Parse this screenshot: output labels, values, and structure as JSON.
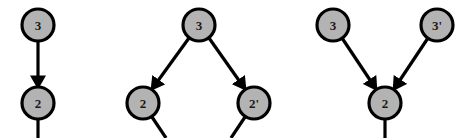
{
  "figure": {
    "background_color": "#ffffff",
    "node_fill_color": "#b3b3b3",
    "node_stroke_color": "#000000",
    "edge_color": "#000000",
    "label_color": "#1a1a1a",
    "node_radius": 16,
    "stroke_width": 3.2
  },
  "panels": [
    {
      "id": "panel-left",
      "name": "single-chain-panel",
      "nodes": [
        {
          "id": "L3",
          "label": "3",
          "cx": 38,
          "cy": 25
        },
        {
          "id": "L2",
          "label": "2",
          "cx": 38,
          "cy": 103
        }
      ],
      "edges": [
        {
          "id": "L3-L2",
          "from": "3",
          "to": "2",
          "x1": 38,
          "y1": 41,
          "x2": 38,
          "y2": 87,
          "arrow": true
        }
      ],
      "tails": [
        {
          "id": "L2-tail",
          "x1": 38,
          "y1": 119,
          "x2": 38,
          "y2": 138
        }
      ]
    },
    {
      "id": "panel-middle",
      "name": "fork-panel",
      "nodes": [
        {
          "id": "M3",
          "label": "3",
          "cx": 199,
          "cy": 25
        },
        {
          "id": "M2",
          "label": "2",
          "cx": 143,
          "cy": 103
        },
        {
          "id": "M2p",
          "label": "2'",
          "cx": 254,
          "cy": 103
        }
      ],
      "edges": [
        {
          "id": "M3-M2",
          "from": "3",
          "to": "2",
          "x1": 189,
          "y1": 38,
          "x2": 152,
          "y2": 89,
          "arrow": true
        },
        {
          "id": "M3-M2p",
          "from": "3",
          "to": "2'",
          "x1": 209,
          "y1": 38,
          "x2": 245,
          "y2": 89,
          "arrow": true
        }
      ],
      "tails": [
        {
          "id": "M2-tail",
          "x1": 152,
          "y1": 117,
          "x2": 166,
          "y2": 138
        },
        {
          "id": "M2p-tail",
          "x1": 245,
          "y1": 117,
          "x2": 231,
          "y2": 138
        }
      ]
    },
    {
      "id": "panel-right",
      "name": "join-panel",
      "nodes": [
        {
          "id": "R3",
          "label": "3",
          "cx": 333,
          "cy": 25
        },
        {
          "id": "R3p",
          "label": "3'",
          "cx": 437,
          "cy": 25
        },
        {
          "id": "R2",
          "label": "2",
          "cx": 385,
          "cy": 103
        }
      ],
      "edges": [
        {
          "id": "R3-R2",
          "from": "3",
          "to": "2",
          "x1": 342,
          "y1": 38,
          "x2": 376,
          "y2": 89,
          "arrow": true
        },
        {
          "id": "R3p-R2",
          "from": "3'",
          "to": "2",
          "x1": 428,
          "y1": 38,
          "x2": 394,
          "y2": 89,
          "arrow": true
        }
      ],
      "tails": [
        {
          "id": "R2-tail",
          "x1": 385,
          "y1": 119,
          "x2": 385,
          "y2": 138
        }
      ]
    }
  ]
}
